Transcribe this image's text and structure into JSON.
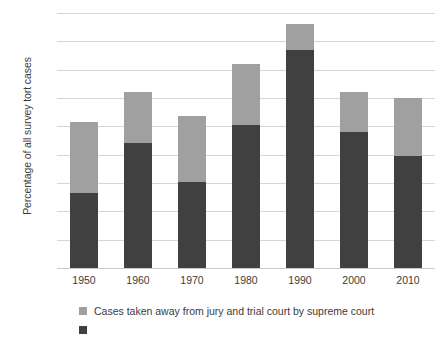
{
  "chart_data": {
    "type": "bar",
    "subtype": "stacked-bar",
    "title": "",
    "xlabel": "",
    "ylabel": "Percentage of all survey tort cases",
    "categories": [
      "1950",
      "1960",
      "1970",
      "1980",
      "1990",
      "2000",
      "2010"
    ],
    "ylim": [
      0,
      90
    ],
    "ytick_labels": [
      "0%",
      "10%",
      "20%",
      "30%",
      "40%",
      "50%",
      "60%",
      "70%",
      "80%",
      "90%"
    ],
    "ytick_values": [
      0,
      10,
      20,
      30,
      40,
      50,
      60,
      70,
      80,
      90
    ],
    "grid": true,
    "legend_position": "bottom-left",
    "series": [
      {
        "name": "Cases taken away from jury and trial court by appellate court",
        "color": "#404040",
        "values": [
          26.5,
          44.0,
          30.5,
          50.5,
          77.0,
          48.0,
          39.5
        ]
      },
      {
        "name": "Cases taken away from jury and trial court by supreme court",
        "color": "#a0a0a0",
        "values": [
          25.0,
          18.0,
          23.0,
          21.5,
          9.0,
          14.0,
          20.5
        ]
      }
    ],
    "totals": [
      51.5,
      62.0,
      53.5,
      72.0,
      86.0,
      62.0,
      60.0
    ],
    "annotations": [
      "Second legend entry is clipped at the bottom edge of the image"
    ]
  },
  "legend": {
    "items": [
      {
        "label": "Cases taken away from jury and trial court by supreme court",
        "color": "#a0a0a0"
      },
      {
        "label": "",
        "color": "#404040"
      }
    ]
  },
  "colors": {
    "segment_top": "#a0a0a0",
    "segment_bottom": "#404040",
    "gridline": "#d6d6d6",
    "text": "#3b3b3b",
    "background": "#ffffff"
  }
}
